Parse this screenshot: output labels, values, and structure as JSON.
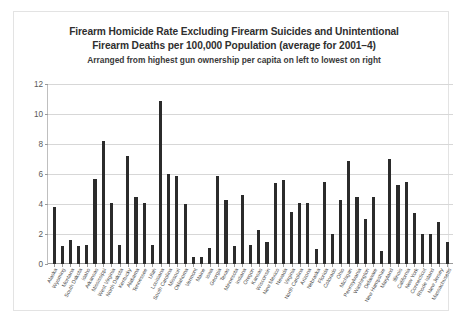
{
  "chart_data": {
    "type": "bar",
    "title": "Firearm Homicide Rate Excluding Firearm Suicides and Unintentional Firearm Deaths per 100,000 Population (average for 2001–4)",
    "title_lines": [
      "Firearm Homicide Rate Excluding Firearm Suicides and Unintentional",
      "Firearm Deaths per 100,000 Population (average for 2001–4)"
    ],
    "subtitle": "Arranged from highest gun ownership per capita on left to lowest on right",
    "xlabel": "",
    "ylabel": "",
    "ylim": [
      0,
      12
    ],
    "yticks": [
      0,
      2,
      4,
      6,
      8,
      10,
      12
    ],
    "ytick_labels": [
      "0",
      "2",
      "4",
      "6",
      "8",
      "10",
      "12"
    ],
    "grid": true,
    "legend": false,
    "bar_color": "#2b2b2b",
    "categories": [
      "Alaska",
      "Wyoming",
      "Montana",
      "South Dakota",
      "Idaho",
      "Arkansas",
      "Mississippi",
      "West Virginia",
      "North Dakota",
      "Kentucky",
      "Alabama",
      "Tennessee",
      "Utah",
      "Louisiana",
      "South Carolina",
      "Missouri",
      "Oklahoma",
      "Vermont",
      "Maine",
      "Iowa",
      "Georgia",
      "Texas",
      "Minnesota",
      "Indiana",
      "Oregon",
      "Kansas",
      "Wisconsin",
      "New Mexico",
      "Nevada",
      "Virginia",
      "North Carolina",
      "Arizona",
      "Nebraska",
      "Florida",
      "Colorado",
      "Ohio",
      "Michigan",
      "Pennsylvania",
      "Washington",
      "Delaware",
      "New Hampshire",
      "Maryland",
      "Illinois",
      "California",
      "New York",
      "Connecticut",
      "Rhode Island",
      "New Jersey",
      "Massachusetts"
    ],
    "values": [
      3.8,
      1.2,
      1.6,
      1.2,
      1.3,
      5.7,
      8.2,
      4.1,
      1.3,
      7.2,
      4.5,
      4.1,
      1.3,
      10.9,
      6.0,
      5.9,
      4.0,
      0.5,
      0.5,
      1.1,
      5.9,
      4.3,
      1.2,
      4.6,
      1.3,
      2.3,
      1.5,
      5.4,
      5.6,
      3.5,
      4.1,
      4.1,
      1.0,
      5.5,
      2.0,
      4.3,
      6.9,
      4.5,
      3.0,
      4.5,
      0.9,
      7.0,
      5.3,
      5.5,
      3.4,
      2.0,
      2.0,
      2.8,
      1.5
    ]
  }
}
